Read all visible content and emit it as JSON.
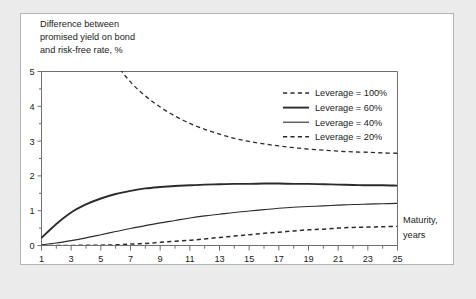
{
  "figure": {
    "background_color": "#ebebeb",
    "card_background": "#ffffff",
    "border_color": "#b4b4b4",
    "line_color": "#2b2b2b",
    "axis_color": "#6f6f6f"
  },
  "chart_data": {
    "type": "line",
    "title": "",
    "ylabel_lines": [
      "Difference between",
      "promised yield on bond",
      "and risk-free rate, %"
    ],
    "ylabel": "Difference between promised yield on bond and risk-free rate, %",
    "xlabel_lines": [
      "Maturity,",
      "years"
    ],
    "xlabel": "Maturity, years",
    "xlim": [
      1,
      25
    ],
    "ylim": [
      0,
      5
    ],
    "yticks": [
      0,
      1,
      2,
      3,
      4,
      5
    ],
    "ytick_labels": [
      "0",
      "1",
      "2",
      "3",
      "4",
      "5"
    ],
    "y_minor_ticks": [
      0.5,
      1.5,
      2.5,
      3.5,
      4.5
    ],
    "xticks": [
      1,
      2,
      3,
      4,
      5,
      6,
      7,
      8,
      9,
      10,
      11,
      12,
      13,
      14,
      15,
      16,
      17,
      18,
      19,
      20,
      21,
      22,
      23,
      24,
      25
    ],
    "xtick_labels_shown": [
      "1",
      "3",
      "5",
      "7",
      "9",
      "11",
      "13",
      "15",
      "17",
      "19",
      "21",
      "23",
      "25"
    ],
    "xtick_labels_values": [
      1,
      3,
      5,
      7,
      9,
      11,
      13,
      15,
      17,
      19,
      21,
      23,
      25
    ],
    "grid": false,
    "legend_position": "top-right",
    "x": [
      1,
      2,
      3,
      4,
      5,
      6,
      7,
      8,
      9,
      10,
      11,
      12,
      13,
      14,
      15,
      16,
      17,
      18,
      19,
      20,
      21,
      22,
      23,
      24,
      25
    ],
    "series": [
      {
        "name": "Leverage = 100%",
        "label": "Leverage = 100%",
        "style": "dashed",
        "width": 1.3,
        "clipped_above_ymax": true,
        "values": [
          16.2,
          11.1,
          8.6,
          7.05,
          6.0,
          5.25,
          4.7,
          4.3,
          3.98,
          3.72,
          3.51,
          3.34,
          3.2,
          3.08,
          2.99,
          2.92,
          2.86,
          2.81,
          2.77,
          2.74,
          2.71,
          2.69,
          2.68,
          2.66,
          2.65
        ]
      },
      {
        "name": "Leverage = 60%",
        "label": "Leverage = 60%",
        "style": "solid",
        "width": 1.9,
        "values": [
          0.22,
          0.62,
          0.95,
          1.18,
          1.35,
          1.48,
          1.57,
          1.64,
          1.68,
          1.71,
          1.73,
          1.75,
          1.76,
          1.77,
          1.77,
          1.78,
          1.78,
          1.77,
          1.77,
          1.76,
          1.75,
          1.74,
          1.73,
          1.73,
          1.72
        ]
      },
      {
        "name": "Leverage = 40%",
        "label": "Leverage = 40%",
        "style": "solid",
        "width": 1.1,
        "values": [
          0.02,
          0.07,
          0.14,
          0.22,
          0.31,
          0.4,
          0.49,
          0.57,
          0.65,
          0.72,
          0.79,
          0.85,
          0.9,
          0.95,
          0.99,
          1.03,
          1.07,
          1.1,
          1.12,
          1.14,
          1.16,
          1.18,
          1.19,
          1.2,
          1.21
        ]
      },
      {
        "name": "Leverage = 20%",
        "label": "Leverage = 20%",
        "style": "dashed",
        "width": 1.5,
        "values": [
          0.0,
          0.0,
          0.0,
          0.01,
          0.01,
          0.02,
          0.04,
          0.06,
          0.09,
          0.12,
          0.15,
          0.19,
          0.23,
          0.27,
          0.31,
          0.35,
          0.38,
          0.42,
          0.45,
          0.47,
          0.5,
          0.52,
          0.53,
          0.54,
          0.55
        ]
      }
    ],
    "legend": [
      "Leverage = 100%",
      "Leverage = 60%",
      "Leverage = 40%",
      "Leverage = 20%"
    ]
  }
}
